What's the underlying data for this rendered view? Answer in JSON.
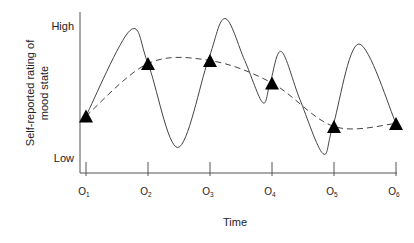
{
  "chart_data": {
    "type": "line",
    "title": "",
    "xlabel": "Time",
    "ylabel": "Self-reported rating of mood state",
    "ylabel_lines": [
      "Self-reported rating of",
      "mood state"
    ],
    "y_tick_labels": [
      {
        "label": "High",
        "value": 9.8
      },
      {
        "label": "Low",
        "value": 1.0
      }
    ],
    "ylim": [
      0,
      10.7
    ],
    "xlim": [
      0.9,
      6.0
    ],
    "grid": false,
    "legend": "none",
    "categories": [
      {
        "main": "O",
        "sub": "1"
      },
      {
        "main": "O",
        "sub": "2"
      },
      {
        "main": "O",
        "sub": "3"
      },
      {
        "main": "O",
        "sub": "4"
      },
      {
        "main": "O",
        "sub": "5"
      },
      {
        "main": "O",
        "sub": "6"
      }
    ],
    "series": [
      {
        "name": "Actual mood (continuous)",
        "style": "solid",
        "x": [
          1.0,
          1.71,
          2.0,
          2.48,
          2.97,
          3.24,
          3.56,
          3.85,
          3.97,
          4.15,
          4.45,
          4.82,
          4.98,
          5.4,
          6.0
        ],
        "y": [
          3.8,
          9.5,
          7.3,
          1.7,
          7.5,
          10.3,
          7.5,
          4.7,
          6.0,
          8.1,
          4.9,
          1.3,
          3.1,
          8.6,
          3.3
        ]
      },
      {
        "name": "Estimated trend from observations",
        "style": "dashed",
        "x": [
          1.0,
          2.0,
          3.0,
          4.0,
          5.0,
          6.0
        ],
        "y": [
          3.8,
          7.3,
          7.5,
          6.0,
          3.1,
          3.3
        ]
      },
      {
        "name": "Observations",
        "style": "marker-triangle",
        "x": [
          1,
          2,
          3,
          4,
          5,
          6
        ],
        "y": [
          3.8,
          7.3,
          7.5,
          6.0,
          3.1,
          3.3
        ]
      }
    ]
  }
}
